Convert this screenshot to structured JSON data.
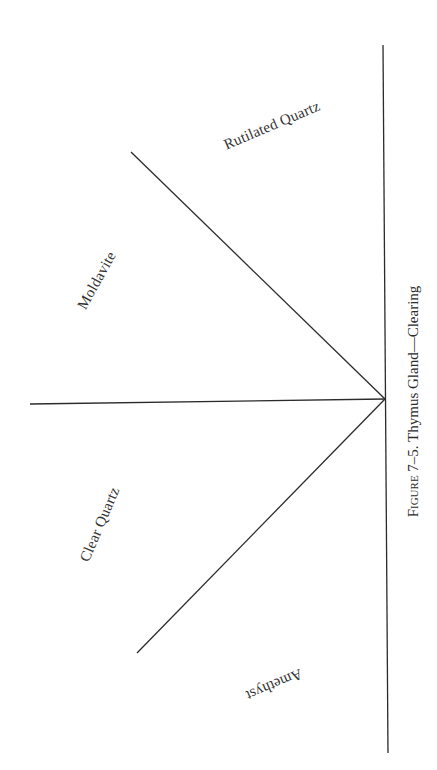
{
  "diagram": {
    "stroke_color": "#2b2b2b",
    "apex": {
      "x": 385,
      "y": 399
    },
    "lines": [
      {
        "name": "vertical-axis",
        "x1": 383,
        "y1": 45,
        "x2": 388,
        "y2": 753
      },
      {
        "name": "horizontal-line",
        "x1": 30,
        "y1": 404,
        "x2": 385,
        "y2": 399
      },
      {
        "name": "upper-diagonal",
        "x1": 131,
        "y1": 152,
        "x2": 385,
        "y2": 399
      },
      {
        "name": "lower-diagonal",
        "x1": 137,
        "y1": 653,
        "x2": 385,
        "y2": 399
      }
    ],
    "labels": {
      "rutilated_quartz": "Rutilated Quartz",
      "moldavite": "Moldavite",
      "clear_quartz": "Clear Quartz",
      "amethyst": "Amethyst"
    }
  },
  "caption": {
    "prefix": "Figure",
    "text": " 7–5. Thymus Gland—Clearing"
  }
}
